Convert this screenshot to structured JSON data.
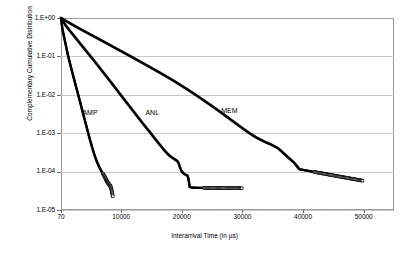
{
  "chart_data": {
    "type": "scatter",
    "title": "",
    "xlabel": "Interarrival Time (in µs)",
    "ylabel": "Complementary Cumulative Distribution",
    "yscale": "log",
    "xscale": "linear",
    "xlim": [
      70,
      55000
    ],
    "ylim": [
      1e-05,
      1.0
    ],
    "grid": "horizontal",
    "legend": "inline-annotations",
    "xticks": [
      70,
      10000,
      20000,
      30000,
      40000,
      50000
    ],
    "xtick_labels": [
      "70",
      "10000",
      "20000",
      "30000",
      "40000",
      "50000"
    ],
    "yticks": [
      1.0,
      0.1,
      0.01,
      0.001,
      0.0001,
      1e-05
    ],
    "ytick_labels": [
      "1.E+00",
      "1.E-01",
      "1.E-02",
      "1.E-03",
      "1.E-04",
      "1.E-05"
    ],
    "marker": "open-square",
    "marker_color": "#000000",
    "series": [
      {
        "name": "AMP",
        "label": "AMP",
        "label_x": 3600,
        "label_y": 0.0035,
        "x": [
          70,
          300,
          700,
          1200,
          1800,
          2400,
          3000,
          3600,
          4200,
          4800,
          5300,
          5700,
          6000,
          6300,
          6500,
          6700,
          6850,
          6980,
          7080,
          7180,
          7260,
          7340,
          7400,
          7460,
          7520,
          7580,
          7640,
          7700,
          7760,
          7820,
          7880,
          7940,
          8000,
          8100,
          8250,
          8400,
          8600
        ],
        "y": [
          1.0,
          0.52,
          0.26,
          0.11,
          0.046,
          0.02,
          0.0088,
          0.0038,
          0.00165,
          0.00072,
          0.00038,
          0.00024,
          0.00018,
          0.00014,
          0.00012,
          0.000105,
          9.6e-05,
          8.9e-05,
          8.3e-05,
          7.8e-05,
          7.4e-05,
          7e-05,
          6.7e-05,
          6.4e-05,
          6.15e-05,
          5.9e-05,
          5.65e-05,
          5.45e-05,
          5.25e-05,
          5.05e-05,
          4.9e-05,
          4.75e-05,
          4.6e-05,
          4.4e-05,
          4.1e-05,
          3.4e-05,
          2.3e-05
        ]
      },
      {
        "name": "ANL",
        "label": "ANL",
        "label_x": 14000,
        "label_y": 0.0035,
        "x": [
          70,
          900,
          2100,
          3400,
          4700,
          6000,
          7300,
          8600,
          9900,
          11200,
          12400,
          13500,
          14500,
          15400,
          16200,
          16900,
          17400,
          17800,
          18100,
          18400,
          18650,
          18900,
          19100,
          19300,
          19500,
          19700,
          19900,
          20050,
          20200,
          20350,
          20500,
          20650,
          20800,
          20950,
          21100,
          21300,
          21600,
          22000,
          22600,
          23400,
          24300,
          25200,
          26100,
          27000,
          27900,
          28700,
          29400,
          29900
        ],
        "y": [
          1.0,
          0.62,
          0.36,
          0.2,
          0.112,
          0.062,
          0.034,
          0.0185,
          0.01,
          0.00545,
          0.0031,
          0.00185,
          0.00118,
          0.00078,
          0.00054,
          0.000395,
          0.00032,
          0.000275,
          0.00025,
          0.000232,
          0.000218,
          0.000205,
          0.000195,
          0.000185,
          0.00016,
          0.000128,
          0.000108,
          9.8e-05,
          9.2e-05,
          8.8e-05,
          8.5e-05,
          8.25e-05,
          8e-05,
          7.8e-05,
          6.4e-05,
          4e-05,
          3.85e-05,
          3.8e-05,
          3.78e-05,
          3.76e-05,
          3.75e-05,
          3.74e-05,
          3.73e-05,
          3.72e-05,
          3.71e-05,
          3.7e-05,
          3.69e-05,
          3.68e-05
        ]
      },
      {
        "name": "MEM",
        "label": "MEM",
        "label_x": 26500,
        "label_y": 0.004,
        "x": [
          70,
          1600,
          3400,
          5300,
          7200,
          9100,
          11000,
          12900,
          14800,
          16700,
          18500,
          20200,
          21800,
          23300,
          24700,
          26000,
          27200,
          28300,
          29300,
          30200,
          31000,
          31700,
          32300,
          32900,
          33400,
          33800,
          34200,
          34550,
          34850,
          35100,
          35350,
          35600,
          35900,
          36250,
          36700,
          37200,
          37800,
          38500,
          39400,
          49800
        ],
        "y": [
          1.0,
          0.72,
          0.5,
          0.345,
          0.238,
          0.163,
          0.112,
          0.0765,
          0.052,
          0.0352,
          0.024,
          0.0163,
          0.0112,
          0.00775,
          0.00545,
          0.0039,
          0.00285,
          0.00212,
          0.00162,
          0.00128,
          0.00104,
          0.00088,
          0.00077,
          0.00069,
          0.00063,
          0.000585,
          0.00055,
          0.00052,
          0.000495,
          0.000472,
          0.00045,
          0.00043,
          0.0004,
          0.00036,
          0.00031,
          0.000262,
          0.000215,
          0.000172,
          0.000115,
          5.8e-05
        ]
      }
    ]
  }
}
